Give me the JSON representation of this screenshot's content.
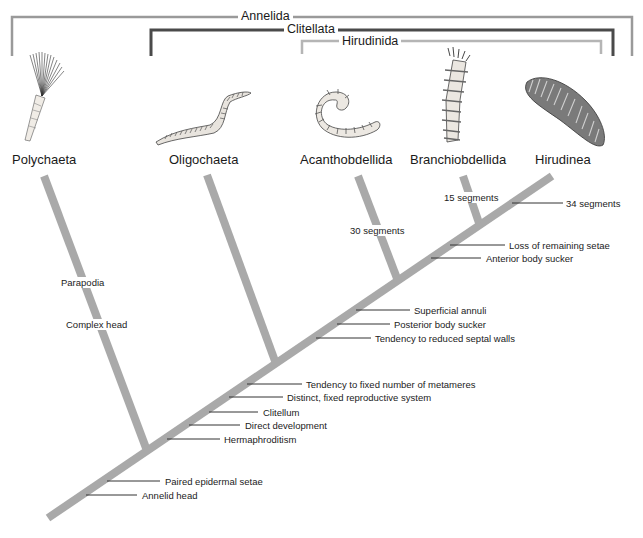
{
  "clades": {
    "annelida": {
      "label": "Annelida",
      "color": "#9a9a9a"
    },
    "clitellata": {
      "label": "Clitellata",
      "color": "#4a4a4a"
    },
    "hirudinida": {
      "label": "Hirudinida",
      "color": "#b5b5b5"
    }
  },
  "taxa": [
    {
      "name": "Polychaeta",
      "illustration": "fan-worm"
    },
    {
      "name": "Oligochaeta",
      "illustration": "earthworm"
    },
    {
      "name": "Acanthobdellida",
      "illustration": "coiled-worm"
    },
    {
      "name": "Branchiobdellida",
      "illustration": "crayfish-worm"
    },
    {
      "name": "Hirudinea",
      "illustration": "leech"
    }
  ],
  "branch_labels": {
    "polychaeta": [
      "Parapodia",
      "Complex head"
    ],
    "acanthobdellida": "30 segments",
    "branchiobdellida": "15 segments",
    "hirudinea": "34 segments"
  },
  "trunk_characters": [
    "Annelid head",
    "Paired epidermal setae",
    "Hermaphroditism",
    "Direct development",
    "Clitellum",
    "Distinct, fixed reproductive system",
    "Tendency to fixed number of metameres",
    "Tendency to reduced septal walls",
    "Posterior body sucker",
    "Superficial annuli",
    "Anterior body sucker",
    "Loss of remaining setae"
  ],
  "colors": {
    "branch": "#a9a9a9",
    "tick": "#333333",
    "text": "#1a1a1a"
  }
}
